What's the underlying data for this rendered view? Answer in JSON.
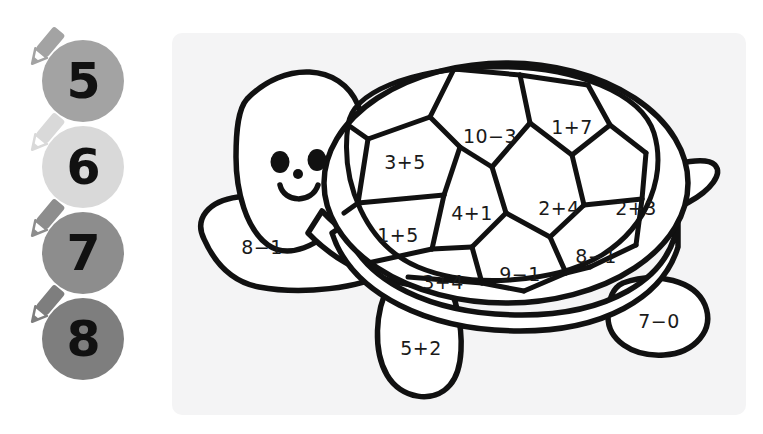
{
  "worksheet": {
    "title": "Color by number addition and subtraction turtle",
    "page_background": "#ffffff",
    "panel_background": "#f4f4f5",
    "ink_color": "#111111"
  },
  "legend": {
    "name": "color-key",
    "items": [
      {
        "number": "5",
        "color": "#a3a3a3",
        "pencil_icon": "pencil-icon"
      },
      {
        "number": "6",
        "color": "#d9d9d9",
        "pencil_icon": "pencil-icon"
      },
      {
        "number": "7",
        "color": "#8d8d8d",
        "pencil_icon": "pencil-icon"
      },
      {
        "number": "8",
        "color": "#7e7e7e",
        "pencil_icon": "pencil-icon"
      }
    ]
  },
  "picture": {
    "name": "turtle-coloring-picture",
    "subject": "turtle",
    "face": {
      "left_eye": "eye-icon",
      "right_eye": "eye-icon",
      "nose": "nose-dot-icon",
      "mouth": "smile-icon"
    },
    "regions": [
      {
        "id": "shell-top-left",
        "equation": "3+5",
        "answer": "8"
      },
      {
        "id": "shell-top-middle",
        "equation": "10−3",
        "answer": "7"
      },
      {
        "id": "shell-top-right",
        "equation": "1+7",
        "answer": "8"
      },
      {
        "id": "shell-mid-left",
        "equation": "1+5",
        "answer": "6"
      },
      {
        "id": "shell-mid-center",
        "equation": "4+1",
        "answer": "5"
      },
      {
        "id": "shell-mid-right",
        "equation": "2+4",
        "answer": "6"
      },
      {
        "id": "shell-mid-far-right",
        "equation": "2+3",
        "answer": "5"
      },
      {
        "id": "shell-bottom-left",
        "equation": "3+4",
        "answer": "7"
      },
      {
        "id": "shell-bottom-center",
        "equation": "9−1",
        "answer": "8"
      },
      {
        "id": "shell-bottom-right",
        "equation": "8−1",
        "answer": "7"
      },
      {
        "id": "front-flipper",
        "equation": "8−1",
        "answer": "7"
      },
      {
        "id": "front-leg",
        "equation": "5+2",
        "answer": "7"
      },
      {
        "id": "rear-leg",
        "equation": "7−0",
        "answer": "7"
      }
    ]
  }
}
